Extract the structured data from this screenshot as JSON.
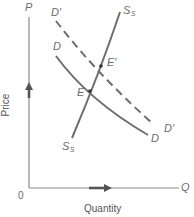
{
  "diagram": {
    "type": "supply-demand",
    "axes": {
      "y_symbol": "P",
      "x_symbol": "Q",
      "origin": "0",
      "y_title": "Price",
      "x_title": "Quantity"
    },
    "curves": {
      "supply": {
        "label_main": "S",
        "label_sub": "S",
        "style": "solid"
      },
      "demand": {
        "label": "D",
        "style": "solid"
      },
      "demand_shifted": {
        "label": "D′",
        "style": "dashed"
      }
    },
    "points": {
      "equilibrium": "E",
      "new_equilibrium": "E′"
    },
    "colors": {
      "line": "#6e6e6e",
      "axis": "#888888",
      "arrow": "#555555",
      "text": "#6b6b6b"
    }
  }
}
